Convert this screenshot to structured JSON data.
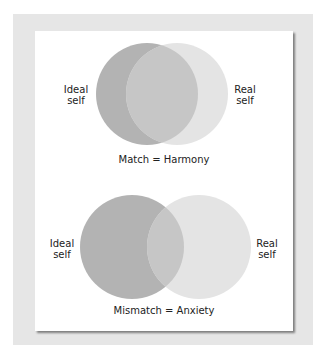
{
  "diagram": {
    "colors": {
      "ideal_self": "#b3b3b3",
      "real_self": "#e4e4e4",
      "overlap": "#c6c6c6",
      "frame": "#e6e6e6",
      "panel": "#ffffff"
    },
    "panels": [
      {
        "id": "match",
        "left_label": "Ideal self",
        "left_label_lines": [
          "Ideal",
          "self"
        ],
        "right_label": "Real self",
        "right_label_lines": [
          "Real",
          "self"
        ],
        "caption": "Match = Harmony",
        "overlap": "large"
      },
      {
        "id": "mismatch",
        "left_label": "Ideal self",
        "left_label_lines": [
          "Ideal",
          "self"
        ],
        "right_label": "Real self",
        "right_label_lines": [
          "Real",
          "self"
        ],
        "caption": "Mismatch = Anxiety",
        "overlap": "small"
      }
    ]
  }
}
